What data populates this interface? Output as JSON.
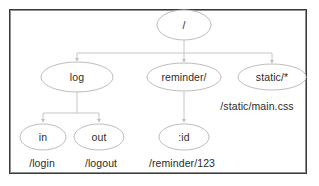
{
  "diagram": {
    "frame": {
      "border_color": "#3a3a3a"
    },
    "colors": {
      "node_stroke": "#b5b5b5",
      "node_fill": "#ffffff",
      "edge": "#c0c0c0",
      "text": "#2e2e2e"
    },
    "nodes": [
      {
        "id": "root",
        "label": "/",
        "cx": 184,
        "cy": 25,
        "rx": 27,
        "ry": 15
      },
      {
        "id": "log",
        "label": "log",
        "cx": 77,
        "cy": 77,
        "rx": 36,
        "ry": 15
      },
      {
        "id": "reminder",
        "label": "reminder/",
        "cx": 184,
        "cy": 77,
        "rx": 37,
        "ry": 14
      },
      {
        "id": "static",
        "label": "static/*",
        "cx": 272,
        "cy": 77,
        "rx": 34,
        "ry": 13
      },
      {
        "id": "in",
        "label": "in",
        "cx": 43,
        "cy": 137,
        "rx": 23,
        "ry": 13
      },
      {
        "id": "out",
        "label": "out",
        "cx": 99,
        "cy": 137,
        "rx": 25,
        "ry": 13
      },
      {
        "id": "id",
        "label": ":id",
        "cx": 184,
        "cy": 137,
        "rx": 25,
        "ry": 13
      }
    ],
    "edges": [
      {
        "from": "root",
        "to": "log",
        "style": "orthogonal"
      },
      {
        "from": "root",
        "to": "reminder",
        "style": "straight"
      },
      {
        "from": "root",
        "to": "static",
        "style": "orthogonal"
      },
      {
        "from": "log",
        "to": "in",
        "style": "orthogonal"
      },
      {
        "from": "log",
        "to": "out",
        "style": "orthogonal"
      },
      {
        "from": "reminder",
        "to": "id",
        "style": "straight"
      }
    ],
    "route_labels": [
      {
        "id": "static-route",
        "text": "/static/main.css",
        "cx": 257,
        "cy": 106
      },
      {
        "id": "login-route",
        "text": "/login",
        "cx": 42,
        "cy": 163
      },
      {
        "id": "logout-route",
        "text": "/logout",
        "cx": 101,
        "cy": 163
      },
      {
        "id": "reminder-route",
        "text": "/reminder/123",
        "cx": 182,
        "cy": 163
      }
    ]
  }
}
